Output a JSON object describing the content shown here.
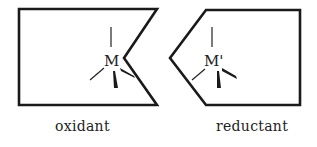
{
  "diagram": {
    "left_shape": {
      "metal_label": "M",
      "caption": "oxidant"
    },
    "right_shape": {
      "metal_label": "M'",
      "caption": "reductant"
    },
    "colors": {
      "stroke": "#1a1a1a",
      "background": "#ffffff"
    }
  }
}
